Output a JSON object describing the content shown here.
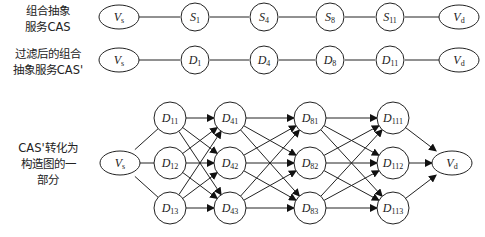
{
  "labels": {
    "row1": [
      "组合抽象",
      "服务CAS"
    ],
    "row2": [
      "过滤后的组合",
      "抽象服务CAS'"
    ],
    "row3": [
      "CAS'转化为",
      "构造图的一",
      "部分"
    ]
  },
  "row1_nodes": [
    {
      "id": "Vs",
      "base": "V",
      "sub": "s",
      "shape": "ellipse"
    },
    {
      "id": "S1",
      "base": "S",
      "sub": "1",
      "shape": "circle"
    },
    {
      "id": "S4",
      "base": "S",
      "sub": "4",
      "shape": "circle"
    },
    {
      "id": "S8",
      "base": "S",
      "sub": "8",
      "shape": "circle"
    },
    {
      "id": "S11",
      "base": "S",
      "sub": "11",
      "shape": "circle"
    },
    {
      "id": "Vd",
      "base": "V",
      "sub": "d",
      "shape": "ellipse"
    }
  ],
  "row2_nodes": [
    {
      "id": "Vs",
      "base": "V",
      "sub": "s",
      "shape": "ellipse"
    },
    {
      "id": "D1",
      "base": "D",
      "sub": "1",
      "shape": "circle"
    },
    {
      "id": "D4",
      "base": "D",
      "sub": "4",
      "shape": "circle"
    },
    {
      "id": "D8",
      "base": "D",
      "sub": "8",
      "shape": "circle"
    },
    {
      "id": "D11",
      "base": "D",
      "sub": "11",
      "shape": "circle"
    },
    {
      "id": "Vd",
      "base": "V",
      "sub": "d",
      "shape": "ellipse"
    }
  ],
  "graph": {
    "source": {
      "base": "V",
      "sub": "s"
    },
    "sink": {
      "base": "V",
      "sub": "d"
    },
    "columns": [
      [
        {
          "base": "D",
          "sub": "11"
        },
        {
          "base": "D",
          "sub": "12"
        },
        {
          "base": "D",
          "sub": "13"
        }
      ],
      [
        {
          "base": "D",
          "sub": "41"
        },
        {
          "base": "D",
          "sub": "42"
        },
        {
          "base": "D",
          "sub": "43"
        }
      ],
      [
        {
          "base": "D",
          "sub": "81"
        },
        {
          "base": "D",
          "sub": "82"
        },
        {
          "base": "D",
          "sub": "83"
        }
      ],
      [
        {
          "base": "D",
          "sub": "111"
        },
        {
          "base": "D",
          "sub": "112"
        },
        {
          "base": "D",
          "sub": "113"
        }
      ]
    ],
    "edges": "fully connected between adjacent columns; source to column 1; column 4 to sink (arrows)"
  }
}
